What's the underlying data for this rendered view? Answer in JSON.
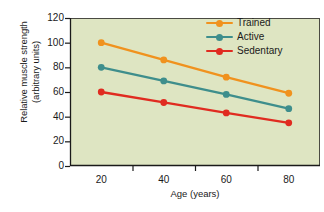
{
  "chart_data": {
    "type": "line",
    "title": "",
    "xlabel": "Age (years)",
    "ylabel": "Relative muscle strength (arbitrary units)",
    "ylabel_line1": "Relative muscle strength",
    "ylabel_line2": "(arbitrary units)",
    "categories": [
      20,
      40,
      60,
      80
    ],
    "x": [
      20,
      40,
      60,
      80
    ],
    "xlim": [
      10,
      90
    ],
    "ylim": [
      0,
      120
    ],
    "xticks": [
      20,
      40,
      60,
      80
    ],
    "yticks": [
      0,
      20,
      40,
      60,
      80,
      100,
      120
    ],
    "grid": false,
    "legend_position": "top-right-inside",
    "series": [
      {
        "name": "Trained",
        "color": "#F0921E",
        "values": [
          100,
          86,
          72,
          59
        ]
      },
      {
        "name": "Active",
        "color": "#3E8E8C",
        "values": [
          80,
          69,
          58,
          46.5
        ]
      },
      {
        "name": "Sedentary",
        "color": "#E02B20",
        "values": [
          60,
          51.5,
          43,
          35
        ]
      }
    ]
  },
  "plot": {
    "background_color": "#DEE5C2",
    "border_color": "#4A4A42",
    "axis_color": "#1a1a1a",
    "text_color": "#1a1a1a"
  },
  "axis": {
    "y_tick_labels": [
      "0",
      "20",
      "40",
      "60",
      "80",
      "100",
      "120"
    ],
    "x_tick_labels": [
      "20",
      "40",
      "60",
      "80"
    ]
  },
  "legend": {
    "items": [
      {
        "label": "Trained",
        "color": "#F0921E"
      },
      {
        "label": "Active",
        "color": "#3E8E8C"
      },
      {
        "label": "Sedentary",
        "color": "#E02B20"
      }
    ]
  }
}
